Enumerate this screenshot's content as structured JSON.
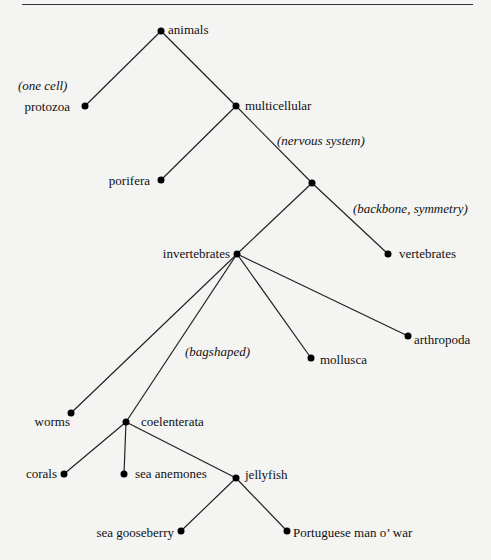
{
  "tree": {
    "nodes": {
      "animals": "animals",
      "protozoa": "protozoa",
      "multicellular": "multicellular",
      "porifera": "porifera",
      "invertebrates": "invertebrates",
      "vertebrates": "vertebrates",
      "arthropoda": "arthropoda",
      "mollusca": "mollusca",
      "worms": "worms",
      "coelenterata": "coelenterata",
      "corals": "corals",
      "sea_anemones": "sea anemones",
      "jellyfish": "jellyfish",
      "sea_gooseberry": "sea gooseberry",
      "portuguese": "Portuguese man o’ war"
    },
    "annotations": {
      "one_cell": "(one cell)",
      "nervous_system": "(nervous system)",
      "backbone": "(backbone, symmetry)",
      "bagshaped": "(bagshaped)"
    }
  }
}
